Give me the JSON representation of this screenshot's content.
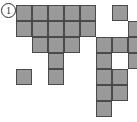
{
  "figure": {
    "label": "①",
    "label_number": "1",
    "title": "",
    "kind": "polyomino-grid-shape"
  },
  "colors": {
    "cell_fill": "#9a9a9a",
    "cell_border": "#4a4a4a",
    "background": "#ffffff",
    "label_text": "#2b2b2b",
    "label_border": "#2b2b2b"
  },
  "grid": {
    "origin_x": 16,
    "origin_y": 5,
    "cell_size": 16,
    "columns": 7,
    "rows": 7,
    "filled_cells": [
      {
        "row": 0,
        "col": 0
      },
      {
        "row": 0,
        "col": 1
      },
      {
        "row": 0,
        "col": 2
      },
      {
        "row": 0,
        "col": 3
      },
      {
        "row": 0,
        "col": 4
      },
      {
        "row": 0,
        "col": 6
      },
      {
        "row": 1,
        "col": 0
      },
      {
        "row": 1,
        "col": 1
      },
      {
        "row": 1,
        "col": 2
      },
      {
        "row": 1,
        "col": 3
      },
      {
        "row": 1,
        "col": 4
      },
      {
        "row": 1,
        "col": 7
      },
      {
        "row": 2,
        "col": 1
      },
      {
        "row": 2,
        "col": 2
      },
      {
        "row": 2,
        "col": 3
      },
      {
        "row": 2,
        "col": 5
      },
      {
        "row": 2,
        "col": 6
      },
      {
        "row": 2,
        "col": 7
      },
      {
        "row": 3,
        "col": 2
      },
      {
        "row": 3,
        "col": 5
      },
      {
        "row": 3,
        "col": 7
      },
      {
        "row": 4,
        "col": 0
      },
      {
        "row": 4,
        "col": 2
      },
      {
        "row": 4,
        "col": 5
      },
      {
        "row": 4,
        "col": 6
      },
      {
        "row": 5,
        "col": 5
      },
      {
        "row": 5,
        "col": 6
      },
      {
        "row": 6,
        "col": 5
      }
    ],
    "row_descriptions": [
      "Row 1: five cells in columns 1-5, gap, one cell in column 7",
      "Row 2: five cells in columns 1-5, gap, one cell in column 8",
      "Row 3: three cells in columns 2-4, gap, three cells in columns 6-8",
      "Row 4: one cell in column 3, one cell in column 6, one cell in column 8",
      "Row 5: one cell in column 1, one cell in column 3, two cells in columns 6-7",
      "Row 6: two cells in columns 6-7",
      "Row 7: one cell in column 6"
    ],
    "total_filled": 28
  }
}
